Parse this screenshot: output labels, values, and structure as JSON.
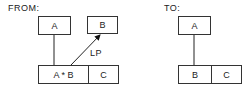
{
  "from": {
    "heading": "FROM:",
    "top_left_box": "A",
    "top_right_box": "B",
    "bottom_box": {
      "left_cell": "A * B",
      "right_cell": "C"
    },
    "arrow_label": "LP"
  },
  "to": {
    "heading": "TO:",
    "top_box": "A",
    "bottom_box": {
      "left_cell": "B",
      "right_cell": "C"
    }
  },
  "colors": {
    "line": "#333333",
    "background": "#ffffff",
    "text": "#222222"
  }
}
